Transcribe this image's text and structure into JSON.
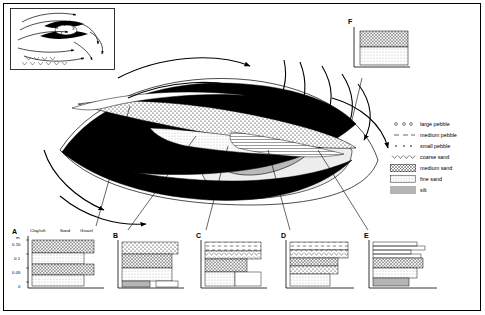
{
  "figure": {
    "title_visible": false,
    "inset": {
      "name": "flow-inset-map",
      "labels": [
        "1",
        "2",
        "3",
        "4",
        "5",
        "6"
      ]
    },
    "legend": {
      "name": "legend",
      "items": [
        {
          "label": "large pebble",
          "pattern": "open-circles"
        },
        {
          "label": "medium pebble",
          "pattern": "dashes"
        },
        {
          "label": "small pebble",
          "pattern": "dots"
        },
        {
          "label": "coarse sand",
          "pattern": "chevrons"
        },
        {
          "label": "medium sand",
          "pattern": "cross-hatch"
        },
        {
          "label": "fine sand",
          "pattern": "fine-dots"
        },
        {
          "label": "silt",
          "pattern": "grey-fill"
        }
      ]
    },
    "logs": [
      {
        "id": "A",
        "name": "log-a",
        "axis_unit": "m",
        "axis_ticks": [
          "0.15",
          "0.1",
          "0.05",
          "0"
        ],
        "headers": [
          "Clay/silt",
          "Sand",
          "Gravel"
        ],
        "beds": [
          "medium sand",
          "fine sand",
          "medium sand",
          "fine sand"
        ]
      },
      {
        "id": "B",
        "name": "log-b",
        "axis_unit": "",
        "axis_ticks": [],
        "headers": [],
        "beds": [
          "small pebble",
          "medium sand",
          "fine sand",
          "silt"
        ]
      },
      {
        "id": "C",
        "name": "log-c",
        "axis_unit": "",
        "axis_ticks": [],
        "headers": [],
        "beds": [
          "medium pebble",
          "coarse sand",
          "medium sand",
          "fine sand"
        ]
      },
      {
        "id": "D",
        "name": "log-d",
        "axis_unit": "",
        "axis_ticks": [],
        "headers": [],
        "beds": [
          "medium pebble",
          "coarse sand",
          "medium sand",
          "fine sand",
          "silt"
        ]
      },
      {
        "id": "E",
        "name": "log-e",
        "axis_unit": "",
        "axis_ticks": [],
        "headers": [],
        "beds": [
          "coarse sand",
          "medium sand",
          "fine sand",
          "silt"
        ]
      },
      {
        "id": "F",
        "name": "log-f",
        "axis_unit": "",
        "axis_ticks": [],
        "headers": [],
        "beds": [
          "medium sand",
          "fine sand"
        ]
      }
    ]
  }
}
